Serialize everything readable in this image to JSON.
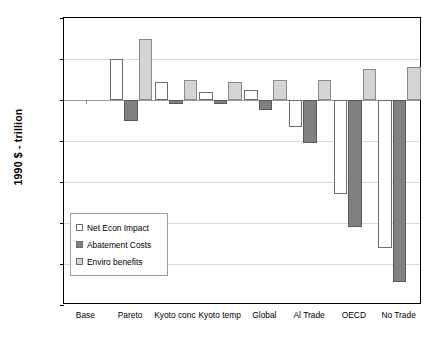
{
  "chart_data": {
    "type": "bar",
    "title": "",
    "xlabel": "",
    "ylabel": "1990 $ - trillion",
    "ylim": [
      -1.0,
      0.4
    ],
    "ytick_labels": [
      "0.4",
      "0.2",
      "0.0",
      "-0.2",
      "-0.4",
      "-0.6",
      "-0.8",
      "-1.0"
    ],
    "ytick_values": [
      0.4,
      0.2,
      0.0,
      -0.2,
      -0.4,
      -0.6,
      -0.8,
      -1.0
    ],
    "grid": true,
    "legend_position": "inside-left-lower",
    "categories": [
      "Base",
      "Pareto",
      "Kyoto conc",
      "Kyoto temp",
      "Global",
      "Al Trade",
      "OECD",
      "No Trade"
    ],
    "series": [
      {
        "name": "Net Econ Impact",
        "color": "#ffffff",
        "values": [
          0.0,
          0.2,
          0.09,
          0.04,
          0.05,
          -0.13,
          -0.46,
          -0.72
        ]
      },
      {
        "name": "Abatement Costs",
        "color": "#808080",
        "values": [
          0.0,
          -0.1,
          -0.02,
          -0.02,
          -0.05,
          -0.21,
          -0.62,
          -0.89
        ]
      },
      {
        "name": "Enviro benefits",
        "color": "#d4d4d4",
        "values": [
          0.0,
          0.3,
          0.1,
          0.09,
          0.1,
          0.1,
          0.15,
          0.16
        ]
      }
    ]
  }
}
